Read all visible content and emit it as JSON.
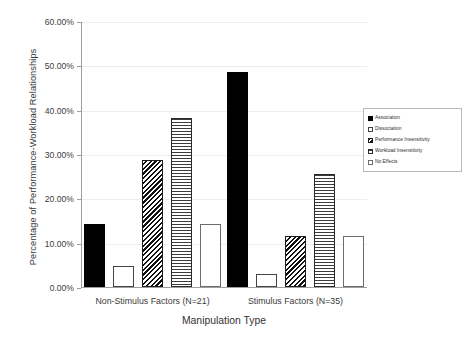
{
  "chart_data": {
    "type": "bar",
    "title": "",
    "xlabel": "Manipulation Type",
    "ylabel": "Percentage of Performance-Workload Relationships",
    "categories": [
      "Non-Stimulus Factors (N=21)",
      "Stimulus Factors (N=35)"
    ],
    "ylim": [
      0,
      60
    ],
    "ytick_labels": [
      "0.00%",
      "10.00%",
      "20.00%",
      "30.00%",
      "40.00%",
      "50.00%",
      "60.00%"
    ],
    "ytick_values": [
      0,
      10,
      20,
      30,
      40,
      50,
      60
    ],
    "grid": true,
    "legend_position": "right",
    "series": [
      {
        "name": "Association",
        "pattern": "solid",
        "values": [
          14.3,
          48.6
        ]
      },
      {
        "name": "Dissociation",
        "pattern": "empty",
        "values": [
          4.8,
          2.9
        ]
      },
      {
        "name": "Performance Insensitivity",
        "pattern": "hatch",
        "values": [
          28.6,
          11.4
        ]
      },
      {
        "name": "Workload Insensitivity",
        "pattern": "lines",
        "values": [
          38.1,
          25.4
        ]
      },
      {
        "name": "No Effects",
        "pattern": "dots",
        "values": [
          14.3,
          11.4
        ]
      }
    ]
  },
  "colors": {
    "axis": "#9e9e9e",
    "gridline": "#ededed",
    "text": "#333333",
    "background": "#ffffff"
  }
}
